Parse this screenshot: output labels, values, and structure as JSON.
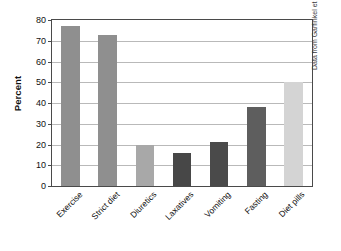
{
  "chart_data": {
    "type": "bar",
    "title": "",
    "subtitle": "",
    "xlabel": "",
    "ylabel": "Percent",
    "ylim": [
      0,
      80
    ],
    "yticks": [
      0,
      10,
      20,
      30,
      40,
      50,
      60,
      70,
      80
    ],
    "ytick_labels": [
      "0",
      "10",
      "20",
      "30",
      "40",
      "50",
      "60",
      "70",
      "80"
    ],
    "grid": true,
    "legend": false,
    "categories": [
      "Exercise",
      "Strict diet",
      "Diuretics",
      "Laxatives",
      "Vomiting",
      "Fasting",
      "Diet pills"
    ],
    "values": [
      77,
      73,
      20,
      16,
      21,
      38,
      50
    ],
    "bar_colors": [
      "#8f8f8f",
      "#8f8f8f",
      "#a8a8a8",
      "#474747",
      "#4a4a4a",
      "#5e5e5e",
      "#d4d4d4"
    ],
    "annotations": [
      "Data from Garfinkel et al., 1995"
    ]
  },
  "axes": {
    "y_title": "Percent",
    "frame_color": "#4a4a4a",
    "gridline_color": "#b9b9b9"
  },
  "caption": {
    "source": "Data from Garfinkel et al., 1995"
  }
}
